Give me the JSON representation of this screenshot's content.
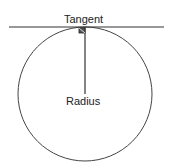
{
  "diagram": {
    "labels": {
      "tangent": "Tangent",
      "radius": "Radius"
    },
    "colors": {
      "stroke": "#333333",
      "text": "#222222",
      "background": "#ffffff"
    },
    "shapes": {
      "circle": {
        "cx": 85,
        "cy": 94,
        "r": 67
      },
      "tangent_line": {
        "x1": 9,
        "y1": 27,
        "x2": 164,
        "y2": 27
      },
      "radius_line": {
        "x1": 85,
        "y1": 27,
        "x2": 85,
        "y2": 94
      },
      "right_angle_marker": {
        "x": 80,
        "y": 28,
        "size": 6
      }
    }
  }
}
